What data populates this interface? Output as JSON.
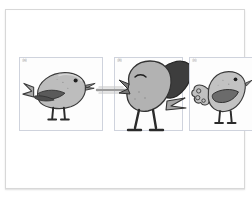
{
  "figure": {
    "background_color": "#ffffff",
    "frame_border_color": "#d8d8d8",
    "panel_border_color": "#cfd3dd"
  },
  "panels": [
    {
      "id": "panel-a",
      "label": "(a)",
      "subject": "cartoon bird facing right, wing folded, tail raised left",
      "body_color": "#b9b9b9",
      "wing_color": "#5a5a5a",
      "outline_color": "#3a3a3a",
      "beak_color": "#8a8a8a"
    },
    {
      "id": "panel-b",
      "label": "(b)",
      "subject": "cartoon bird facing left, dark wing raised, eye closed, whistle line at beak",
      "body_color": "#b0b0b0",
      "wing_color": "#3d3d3d",
      "outline_color": "#333333",
      "beak_color": "#787878"
    },
    {
      "id": "panel-c",
      "label": "(c)",
      "subject": "cartoon bird facing right, ruffled tail, dark wing patch",
      "body_color": "#c2c2c2",
      "wing_color": "#6b6b6b",
      "outline_color": "#3a3a3a",
      "beak_color": "#8a8a8a"
    }
  ],
  "caption": {
    "prefix": "Fig.",
    "number": "1.",
    "text": "— — —"
  }
}
